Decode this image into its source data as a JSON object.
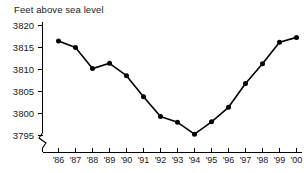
{
  "chart_data": {
    "type": "line",
    "title": "Feet above sea level",
    "xlabel": "",
    "ylabel": "Feet above sea level",
    "categories": [
      "'86",
      "'87",
      "'88",
      "'89",
      "'90",
      "'91",
      "'92",
      "'93",
      "'94",
      "'95",
      "'96",
      "'97",
      "'98",
      "'99",
      "'00"
    ],
    "values": [
      3816.5,
      3815.0,
      3810.2,
      3811.4,
      3808.6,
      3803.8,
      3799.3,
      3798.0,
      3795.3,
      3798.1,
      3801.4,
      3806.8,
      3811.3,
      3816.2,
      3817.3
    ],
    "ytick_labels": [
      "3820",
      "3815",
      "3810",
      "3805",
      "3800",
      "3795"
    ],
    "ytick_values": [
      3820,
      3815,
      3810,
      3805,
      3800,
      3795
    ],
    "ylim": [
      3793.5,
      3821.5
    ],
    "grid": false,
    "legend": null,
    "axis_break": true,
    "marker": "filled-circle",
    "line_color": "#000000",
    "marker_color": "#000000",
    "axis_color": "#000000",
    "background_color": "#ffffff"
  }
}
